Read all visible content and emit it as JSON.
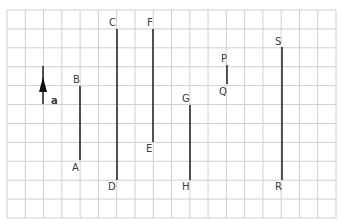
{
  "grid": {
    "x0": 7,
    "y0": 10,
    "x1": 336,
    "y1": 218,
    "columns": 18,
    "rows": 11,
    "line_color": "#cfcfcf"
  },
  "segment_color": "#2a2a2a",
  "arrow": {
    "label": "a",
    "x": 43,
    "y_top": 66,
    "y_bottom": 104,
    "head_tip_y": 77,
    "head_base_y": 92,
    "label_x": 51,
    "label_y": 104
  },
  "segments": [
    {
      "top_label": "B",
      "bottom_label": "A",
      "x": 80,
      "y_top": 86,
      "y_bottom": 160,
      "top_label_pos": [
        73,
        83
      ],
      "bottom_label_pos": [
        72,
        171
      ]
    },
    {
      "top_label": "C",
      "bottom_label": "D",
      "x": 117,
      "y_top": 29,
      "y_bottom": 180,
      "top_label_pos": [
        109,
        26
      ],
      "bottom_label_pos": [
        108,
        190
      ]
    },
    {
      "top_label": "F",
      "bottom_label": "E",
      "x": 153,
      "y_top": 29,
      "y_bottom": 142,
      "top_label_pos": [
        147,
        26
      ],
      "bottom_label_pos": [
        146,
        152
      ]
    },
    {
      "top_label": "G",
      "bottom_label": "H",
      "x": 190,
      "y_top": 105,
      "y_bottom": 180,
      "top_label_pos": [
        182,
        102
      ],
      "bottom_label_pos": [
        182,
        190
      ]
    },
    {
      "top_label": "P",
      "bottom_label": "Q",
      "x": 227,
      "y_top": 65,
      "y_bottom": 84,
      "top_label_pos": [
        221,
        62
      ],
      "bottom_label_pos": [
        219,
        95
      ]
    },
    {
      "top_label": "S",
      "bottom_label": "R",
      "x": 282,
      "y_top": 47,
      "y_bottom": 180,
      "top_label_pos": [
        275,
        45
      ],
      "bottom_label_pos": [
        275,
        190
      ]
    }
  ]
}
